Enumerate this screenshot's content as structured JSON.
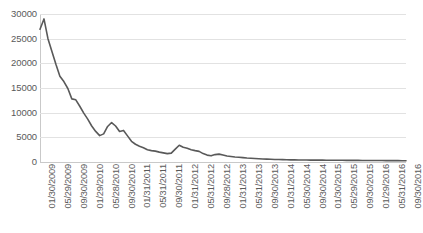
{
  "chart_data": {
    "type": "line",
    "title": "",
    "subtitle": "",
    "xlabel": "",
    "ylabel": "",
    "ylim": [
      0,
      30000
    ],
    "y_ticks": [
      0,
      5000,
      10000,
      15000,
      20000,
      25000,
      30000
    ],
    "y_tick_labels": [
      "0",
      "5000",
      "10000",
      "15000",
      "20000",
      "25000",
      "30000"
    ],
    "grid": true,
    "grid_axis": "y",
    "legend": "none",
    "line_color": "#595959",
    "grid_color": "#e2e2e2",
    "axis_color": "#c9c9c9",
    "tick_label_color": "#5a5a5a",
    "x_tick_labels": [
      "01/30/2009",
      "05/29/2009",
      "09/30/2009",
      "01/29/2010",
      "05/28/2010",
      "09/30/2010",
      "01/31/2011",
      "05/31/2011",
      "09/30/2011",
      "01/31/2012",
      "05/31/2012",
      "09/28/2012",
      "01/31/2013",
      "05/31/2013",
      "09/30/2013",
      "01/31/2014",
      "05/30/2014",
      "09/30/2014",
      "01/30/2015",
      "05/29/2015",
      "09/30/2015",
      "01/29/2016",
      "05/31/2016",
      "09/30/2016"
    ],
    "categories": [
      "01/30/2009",
      "02/27/2009",
      "03/31/2009",
      "04/30/2009",
      "05/29/2009",
      "06/30/2009",
      "07/31/2009",
      "08/31/2009",
      "09/30/2009",
      "10/30/2009",
      "11/30/2009",
      "12/31/2009",
      "01/29/2010",
      "02/26/2010",
      "03/31/2010",
      "04/30/2010",
      "05/28/2010",
      "06/30/2010",
      "07/30/2010",
      "08/31/2010",
      "09/30/2010",
      "10/29/2010",
      "11/30/2010",
      "12/31/2010",
      "01/31/2011",
      "02/28/2011",
      "03/31/2011",
      "04/29/2011",
      "05/31/2011",
      "06/30/2011",
      "07/29/2011",
      "08/31/2011",
      "09/30/2011",
      "10/31/2011",
      "11/30/2011",
      "12/30/2011",
      "01/31/2012",
      "02/29/2012",
      "03/30/2012",
      "04/30/2012",
      "05/31/2012",
      "06/29/2012",
      "07/31/2012",
      "08/31/2012",
      "09/28/2012",
      "10/31/2012",
      "11/30/2012",
      "12/31/2012",
      "01/31/2013",
      "02/28/2013",
      "03/28/2013",
      "04/30/2013",
      "05/31/2013",
      "06/28/2013",
      "07/31/2013",
      "08/30/2013",
      "09/30/2013",
      "10/31/2013",
      "11/29/2013",
      "12/31/2013",
      "01/31/2014",
      "02/28/2014",
      "03/31/2014",
      "04/30/2014",
      "05/30/2014",
      "06/30/2014",
      "07/31/2014",
      "08/29/2014",
      "09/30/2014",
      "10/31/2014",
      "11/28/2014",
      "12/31/2014",
      "01/30/2015",
      "02/27/2015",
      "03/31/2015",
      "04/30/2015",
      "05/29/2015",
      "06/30/2015",
      "07/31/2015",
      "08/31/2015",
      "09/30/2015",
      "10/30/2015",
      "11/30/2015",
      "12/31/2015",
      "01/29/2016",
      "02/29/2016",
      "03/31/2016",
      "04/29/2016",
      "05/31/2016",
      "06/30/2016",
      "07/29/2016",
      "08/31/2016",
      "09/30/2016"
    ],
    "values": [
      26900,
      29000,
      25000,
      22400,
      19800,
      17400,
      16300,
      14900,
      12800,
      12600,
      11300,
      9900,
      8700,
      7300,
      6200,
      5350,
      5700,
      7200,
      8000,
      7300,
      6200,
      6400,
      5300,
      4200,
      3600,
      3200,
      2900,
      2500,
      2300,
      2200,
      2000,
      1850,
      1700,
      1800,
      2600,
      3400,
      3000,
      2800,
      2500,
      2300,
      2150,
      1700,
      1400,
      1250,
      1500,
      1600,
      1400,
      1200,
      1100,
      1000,
      950,
      880,
      800,
      750,
      700,
      660,
      620,
      580,
      550,
      520,
      500,
      480,
      460,
      440,
      430,
      420,
      410,
      400,
      390,
      380,
      375,
      370,
      360,
      355,
      350,
      345,
      340,
      335,
      330,
      325,
      320,
      315,
      310,
      305,
      300,
      295,
      290,
      285,
      280,
      275,
      270,
      265,
      260
    ]
  }
}
